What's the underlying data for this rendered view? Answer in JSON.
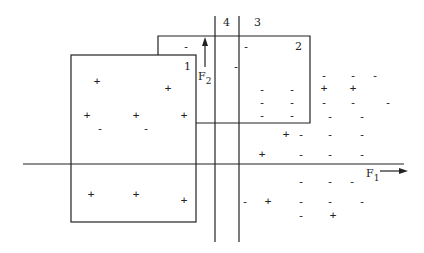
{
  "diagram": {
    "title": "",
    "axes": {
      "f1": {
        "label": "F",
        "subscript": "1",
        "direction": "right"
      },
      "f2": {
        "label": "F",
        "subscript": "2",
        "direction": "up"
      }
    },
    "regions": [
      {
        "id": "1",
        "label": "1",
        "type": "box"
      },
      {
        "id": "2",
        "label": "2",
        "type": "box"
      },
      {
        "id": "3",
        "label": "3",
        "type": "vertical-boundary"
      },
      {
        "id": "4",
        "label": "4",
        "type": "vertical-boundary"
      }
    ],
    "points": [
      {
        "sym": "-",
        "x": 186,
        "y": 46
      },
      {
        "sym": "-",
        "x": 246,
        "y": 46
      },
      {
        "sym": "-",
        "x": 236,
        "y": 66
      },
      {
        "sym": "+",
        "x": 97,
        "y": 81
      },
      {
        "sym": "+",
        "x": 168,
        "y": 88
      },
      {
        "sym": "-",
        "x": 262,
        "y": 89
      },
      {
        "sym": "-",
        "x": 292,
        "y": 89
      },
      {
        "sym": "-",
        "x": 324,
        "y": 75
      },
      {
        "sym": "-",
        "x": 353,
        "y": 75
      },
      {
        "sym": "-",
        "x": 375,
        "y": 75
      },
      {
        "sym": "+",
        "x": 324,
        "y": 88
      },
      {
        "sym": "+",
        "x": 353,
        "y": 88
      },
      {
        "sym": "+",
        "x": 87,
        "y": 115
      },
      {
        "sym": "+",
        "x": 136,
        "y": 115
      },
      {
        "sym": "+",
        "x": 184,
        "y": 115
      },
      {
        "sym": "-",
        "x": 100,
        "y": 128
      },
      {
        "sym": "-",
        "x": 146,
        "y": 128
      },
      {
        "sym": "-",
        "x": 262,
        "y": 102
      },
      {
        "sym": "-",
        "x": 292,
        "y": 102
      },
      {
        "sym": "-",
        "x": 324,
        "y": 102
      },
      {
        "sym": "-",
        "x": 353,
        "y": 102
      },
      {
        "sym": "-",
        "x": 388,
        "y": 102
      },
      {
        "sym": "-",
        "x": 262,
        "y": 115
      },
      {
        "sym": "-",
        "x": 292,
        "y": 115
      },
      {
        "sym": "-",
        "x": 330,
        "y": 116
      },
      {
        "sym": "-",
        "x": 362,
        "y": 116
      },
      {
        "sym": "+",
        "x": 286,
        "y": 134
      },
      {
        "sym": "-",
        "x": 301,
        "y": 134
      },
      {
        "sym": "-",
        "x": 330,
        "y": 134
      },
      {
        "sym": "-",
        "x": 362,
        "y": 134
      },
      {
        "sym": "+",
        "x": 262,
        "y": 154
      },
      {
        "sym": "-",
        "x": 301,
        "y": 154
      },
      {
        "sym": "-",
        "x": 330,
        "y": 154
      },
      {
        "sym": "-",
        "x": 362,
        "y": 154
      },
      {
        "sym": "-",
        "x": 301,
        "y": 181
      },
      {
        "sym": "-",
        "x": 330,
        "y": 181
      },
      {
        "sym": "-",
        "x": 352,
        "y": 181
      },
      {
        "sym": "+",
        "x": 91,
        "y": 194
      },
      {
        "sym": "+",
        "x": 136,
        "y": 194
      },
      {
        "sym": "+",
        "x": 184,
        "y": 200
      },
      {
        "sym": "-",
        "x": 245,
        "y": 201
      },
      {
        "sym": "+",
        "x": 268,
        "y": 201
      },
      {
        "sym": "-",
        "x": 301,
        "y": 201
      },
      {
        "sym": "-",
        "x": 330,
        "y": 201
      },
      {
        "sym": "-",
        "x": 362,
        "y": 201
      },
      {
        "sym": "-",
        "x": 301,
        "y": 215
      },
      {
        "sym": "+",
        "x": 333,
        "y": 215
      }
    ]
  },
  "colors": {
    "ink": "#222222",
    "background": "#ffffff"
  }
}
